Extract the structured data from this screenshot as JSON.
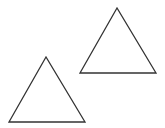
{
  "canvas": {
    "width": 165,
    "height": 128,
    "background": "#ffffff"
  },
  "style": {
    "stroke": "#333333",
    "stroke_width": 1.3,
    "fill": "none"
  },
  "shapes": [
    {
      "type": "triangle",
      "name": "top-right-triangle",
      "points": "117,8 80,73 156,73"
    },
    {
      "type": "triangle",
      "name": "bottom-left-triangle",
      "points": "46,57 9,122 85,122"
    }
  ]
}
